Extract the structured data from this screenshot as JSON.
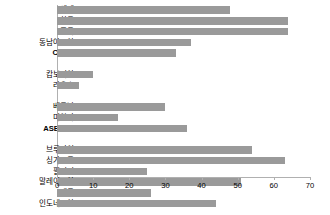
{
  "chart_data": {
    "type": "bar",
    "orientation": "horizontal",
    "title": "",
    "xlabel": "",
    "ylabel": "",
    "xlim": [
      0,
      70
    ],
    "xticks": [
      0,
      10,
      20,
      30,
      40,
      50,
      60,
      70
    ],
    "grid": false,
    "legend": false,
    "bar_color": "#9a9a9a",
    "axis_color": "#b0b0b0",
    "categories": [
      "세계",
      "한국",
      "중국",
      "동남아시아",
      "CLMV",
      "",
      "캄보디아",
      "라오스",
      "",
      "베트남",
      "미얀마",
      "ASEAN6",
      "",
      "브루나이",
      "싱가포르",
      "필리핀",
      "말레이시아",
      "태국",
      "인도네시아"
    ],
    "values": [
      48,
      64,
      64,
      37,
      33,
      null,
      10,
      6,
      null,
      30,
      17,
      36,
      null,
      54,
      63,
      25,
      51,
      26,
      44
    ],
    "emphasis": [
      false,
      false,
      false,
      false,
      true,
      false,
      false,
      false,
      false,
      false,
      false,
      true,
      false,
      false,
      false,
      false,
      false,
      false,
      false
    ]
  }
}
